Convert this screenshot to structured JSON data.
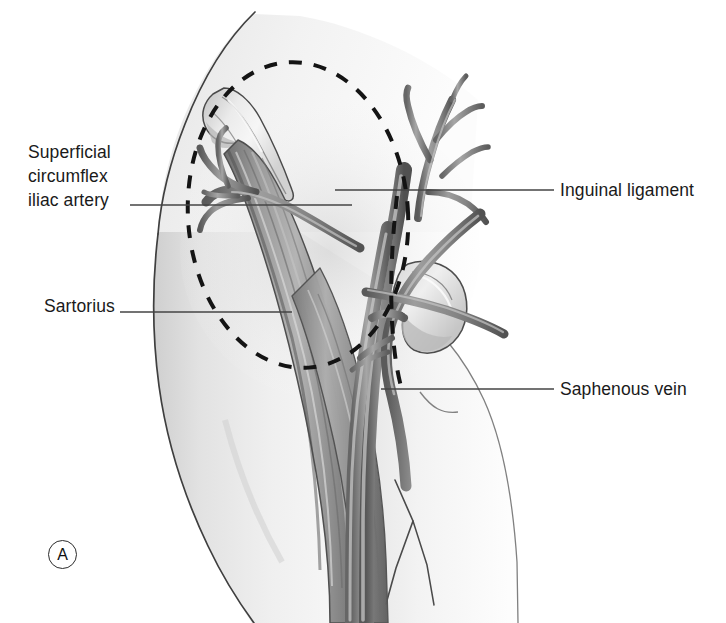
{
  "figure": {
    "type": "medical-anatomical-illustration",
    "panel_marker": "A",
    "style": "grayscale pencil and wash medical illustration",
    "colors": {
      "background": "#ffffff",
      "skin_light": "#f2f2f2",
      "skin_shade": "#d9d9d9",
      "muscle_mid": "#8f8f8f",
      "muscle_dark": "#5e5e5e",
      "vessel": "#7d7d7d",
      "vessel_dark": "#565656",
      "bone_light": "#ececec",
      "outline": "#3a3a3a",
      "dashes": "#141414",
      "leader_line": "#444444",
      "text": "#1a1a1a"
    }
  },
  "labels": {
    "superficial_circumflex_iliac_artery": {
      "line1": "Superficial",
      "line2": "circumflex",
      "line3": "iliac artery"
    },
    "sartorius": "Sartorius",
    "inguinal_ligament": "Inguinal ligament",
    "saphenous_vein": "Saphenous vein"
  },
  "annotations": {
    "dashed_ellipse": "planned incision / exposure outline over femoral triangle",
    "dashed_vertical_line": "femoral vessel axis marking",
    "panel_letter": "A"
  }
}
